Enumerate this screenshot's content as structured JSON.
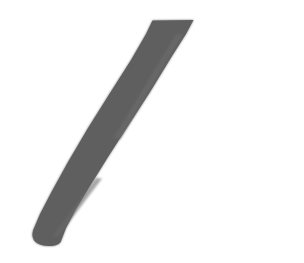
{
  "canvas": {
    "width": 304,
    "height": 263,
    "background_color": "#ffffff",
    "description": "Single gray diagonal brush stroke on a blank white canvas"
  },
  "artwork": {
    "name": "diagonal-stroke",
    "kind": "freehand-brush-mark",
    "stroke_color": "#605f5f",
    "stroke_color_light": "#6b6a6a",
    "stroke_color_edge": "#757474",
    "opacity": 1,
    "start_point": {
      "x": 193,
      "y": 20
    },
    "end_point": {
      "x": 35,
      "y": 245
    },
    "average_width_px": 40,
    "top_cap": "flat-slanted",
    "bottom_cap": "rounded",
    "outline_path": "M 152.5 20.5 L 193.5 20.0 L 186.0 34.0 L 172.0 56.0 L 150.0 92.0 L 128.0 126.0 L 108.0 157.0 L 90.0 186.0 L 76.0 209.0 L 66.0 228.0 L 62.0 238.5 Q 60.5 245.5 52.0 246.0 Q 41.0 246.8 35.5 242.0 Q 31.0 237.5 33.0 230.5 L 40.0 214.0 L 52.0 191.0 L 68.0 162.0 L 88.0 128.0 L 110.0 93.0 L 131.0 60.0 L 146.0 34.0 Z",
    "highlight_path": "M 176.0 34.0 L 183.0 34.5 L 120.0 139.0 L 113.5 138.0 Z",
    "highlight_path_2": "M 96.0 178.0 L 102.0 178.5 L 58.0 237.0 L 52.5 236.0 Z"
  }
}
